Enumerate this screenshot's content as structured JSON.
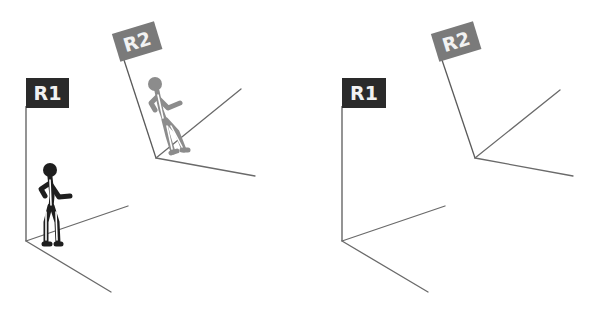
{
  "diagram": {
    "colors": {
      "r1_flag": "#2a2a2a",
      "r2_flag": "#7a7a7a",
      "r1_figure": "#1e1e1e",
      "r2_figure": "#8c8c8c",
      "axes": "#6a6a6a",
      "background": "#ffffff"
    },
    "panels": [
      {
        "id": "left",
        "frames": [
          {
            "label": "R1",
            "has_figure": true,
            "figure_color": "black"
          },
          {
            "label": "R2",
            "has_figure": true,
            "figure_color": "gray"
          }
        ]
      },
      {
        "id": "right",
        "frames": [
          {
            "label": "R1",
            "has_figure": false
          },
          {
            "label": "R2",
            "has_figure": false
          }
        ]
      }
    ]
  }
}
